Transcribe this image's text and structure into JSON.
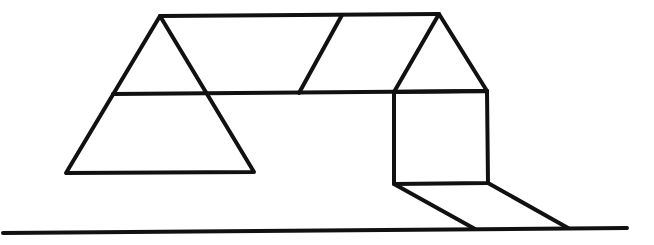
{
  "figure": {
    "stroke_color": "#111111",
    "background_color": "#ffffff",
    "shapes": {
      "ground_line": [
        [
          3,
          233
        ],
        [
          627,
          228
        ]
      ],
      "left_triangle": [
        [
          160,
          16
        ],
        [
          66,
          173
        ],
        [
          254,
          172
        ]
      ],
      "top_band_top_edge": [
        [
          160,
          16
        ],
        [
          439,
          14
        ]
      ],
      "top_band_bottom_edge": [
        [
          113,
          94
        ],
        [
          394,
          92
        ]
      ],
      "band_right_segment": [
        [
          394,
          92
        ],
        [
          487,
          91
        ]
      ],
      "band_diagonal": [
        [
          342,
          15
        ],
        [
          299,
          93
        ]
      ],
      "right_roof_triangle": [
        [
          439,
          14
        ],
        [
          394,
          92
        ],
        [
          487,
          91
        ]
      ],
      "right_square": [
        [
          394,
          92
        ],
        [
          487,
          91
        ],
        [
          488,
          183
        ],
        [
          394,
          184
        ]
      ],
      "shadow_left_edge": [
        [
          394,
          184
        ],
        [
          475,
          229
        ]
      ],
      "shadow_right_edge": [
        [
          488,
          183
        ],
        [
          568,
          228
        ]
      ]
    }
  }
}
